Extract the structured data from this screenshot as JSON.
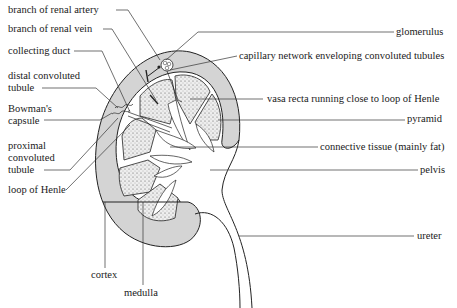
{
  "figure": {
    "colors": {
      "cortex_fill": "#d4d4d4",
      "medulla_fill": "#e6e6e6",
      "line": "#222222",
      "background": "#ffffff"
    }
  },
  "labels_left": [
    {
      "id": "branch-renal-artery",
      "text": "branch of renal artery"
    },
    {
      "id": "branch-renal-vein",
      "text": "branch of renal vein"
    },
    {
      "id": "collecting-duct",
      "text": "collecting duct"
    },
    {
      "id": "distal-convoluted-tubule",
      "line1": "distal convoluted",
      "line2": "tubule"
    },
    {
      "id": "bowmans-capsule",
      "line1": "Bowman's",
      "line2": "capsule"
    },
    {
      "id": "proximal-convoluted-tubule",
      "line1": "proximal",
      "line2": "convoluted",
      "line3": "tubule"
    },
    {
      "id": "loop-of-henle",
      "text": "loop of Henle"
    }
  ],
  "labels_right": [
    {
      "id": "glomerulus",
      "text": "glomerulus"
    },
    {
      "id": "capillary-network",
      "text": "capillary network enveloping convoluted tubules"
    },
    {
      "id": "vasa-recta",
      "text": "vasa recta running close to loop of Henle"
    },
    {
      "id": "pyramid",
      "text": "pyramid"
    },
    {
      "id": "connective-tissue",
      "text": "connective tissue (mainly fat)"
    },
    {
      "id": "pelvis",
      "text": "pelvis"
    },
    {
      "id": "ureter",
      "text": "ureter"
    }
  ],
  "labels_bottom": [
    {
      "id": "cortex",
      "text": "cortex"
    },
    {
      "id": "medulla",
      "text": "medulla"
    }
  ]
}
